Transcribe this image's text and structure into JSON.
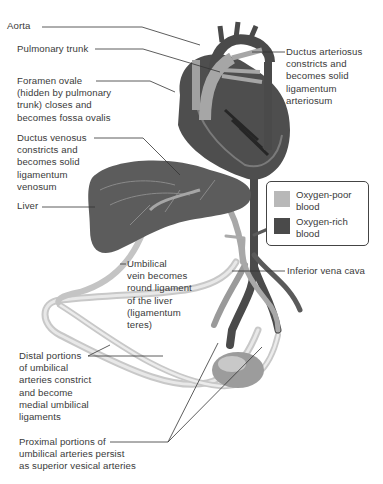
{
  "figure": {
    "labels": {
      "aorta": "Aorta",
      "pulmonary_trunk": "Pulmonary trunk",
      "foramen_ovale": "Foramen ovale\n(hidden by pulmonary\ntrunk) closes and\nbecomes fossa ovalis",
      "ductus_venosus": "Ductus venosus\nconstricts and\nbecomes solid\nligamentum\nvenosum",
      "liver": "Liver",
      "ductus_arteriosus": "Ductus arteriosus\nconstricts and\nbecomes solid\nligamentum\narteriosum",
      "umbilical_vein": "Umbilical\nvein becomes\nround ligament\nof the liver\n(ligamentum\nteres)",
      "inferior_vena_cava": "Inferior vena cava",
      "distal_umbilical_arteries": "Distal portions\nof umbilical\narteries constrict\nand become\nmedial umbilical\nligaments",
      "proximal_umbilical_arteries": "Proximal portions of\numbilical arteries persist\nas superior vesical arteries"
    },
    "legend": {
      "items": [
        {
          "label": "Oxygen-poor\nblood",
          "color": "#b8b8b8"
        },
        {
          "label": "Oxygen-rich\nblood",
          "color": "#4a4a4a"
        }
      ]
    },
    "colors": {
      "oxygen_poor": "#b8b8b8",
      "oxygen_rich": "#4a4a4a",
      "leader_line": "#333333"
    }
  }
}
